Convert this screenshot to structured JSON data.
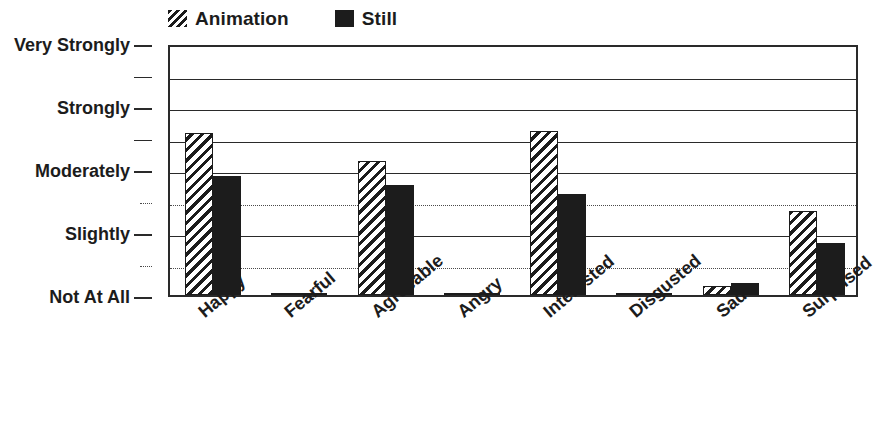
{
  "legend": {
    "position": "top-left",
    "entries": [
      {
        "label": "Animation",
        "swatch": "hatched-diagonal",
        "color": "#1c1c1c"
      },
      {
        "label": "Still",
        "swatch": "solid-black",
        "color": "#1c1c1c"
      }
    ]
  },
  "chart_data": {
    "type": "bar",
    "title": "",
    "xlabel": "",
    "ylabel": "",
    "grid": true,
    "legend_position": "top-left",
    "categories": [
      "Happy",
      "Fearful",
      "Agreeable",
      "Angry",
      "Interested",
      "Disgusted",
      "Sad",
      "Surprised"
    ],
    "ytick_labels": [
      "Not At All",
      "Slightly",
      "Moderately",
      "Strongly",
      "Very Strongly"
    ],
    "ytick_values": [
      0,
      1,
      2,
      3,
      4
    ],
    "yminor_ticks": [
      0.5,
      1.5,
      2.5,
      3.5
    ],
    "ylim": [
      0,
      4
    ],
    "series": [
      {
        "name": "Animation",
        "style": "hatched-diagonal",
        "color": "#1c1c1c",
        "values": [
          2.57,
          0.02,
          2.13,
          0.02,
          2.6,
          0.03,
          0.14,
          1.33
        ]
      },
      {
        "name": "Still",
        "style": "solid",
        "color": "#1c1c1c",
        "values": [
          1.89,
          0.02,
          1.75,
          0.02,
          1.6,
          0.03,
          0.19,
          0.83
        ]
      }
    ]
  },
  "colors": {
    "axis": "#2a2a2a",
    "gridline_major": "#2a2a2a",
    "gridline_minor": "#4a4a4a",
    "background": "#ffffff",
    "ink": "#1c1c1c"
  }
}
